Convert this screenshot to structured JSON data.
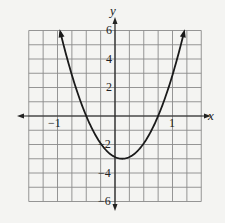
{
  "chart_data": {
    "type": "line",
    "title": "",
    "xlabel": "x",
    "ylabel": "y",
    "xlim": [
      -1.5,
      1.5
    ],
    "ylim": [
      -6,
      6
    ],
    "grid": true,
    "grid_step_x": 0.25,
    "grid_step_y": 1,
    "x_tick_labels": [
      "-1",
      "1"
    ],
    "y_tick_labels": [
      "6",
      "4",
      "2",
      "-2",
      "-4",
      "-6"
    ],
    "series": [
      {
        "name": "parabola",
        "description": "Upward-opening parabola with arrowheads at both ends",
        "x_intercepts": [
          -0.5,
          0.75
        ],
        "vertex": [
          0.125,
          -3
        ],
        "points": [
          {
            "x": -0.95,
            "y": 6
          },
          {
            "x": -0.75,
            "y": 3.0
          },
          {
            "x": -0.5,
            "y": 0
          },
          {
            "x": -0.25,
            "y": -1.9
          },
          {
            "x": 0,
            "y": -2.9
          },
          {
            "x": 0.125,
            "y": -3.0
          },
          {
            "x": 0.25,
            "y": -2.9
          },
          {
            "x": 0.5,
            "y": -1.9
          },
          {
            "x": 0.75,
            "y": 0
          },
          {
            "x": 1.0,
            "y": 2.9
          },
          {
            "x": 1.2,
            "y": 6
          }
        ]
      }
    ]
  },
  "labels": {
    "x_axis": "x",
    "y_axis": "y",
    "x_neg1": "−1",
    "x_pos1": "1",
    "y6": "6",
    "y4": "4",
    "y2": "2",
    "yneg2": "−2",
    "yneg4": "−4",
    "yneg6": "−6"
  }
}
